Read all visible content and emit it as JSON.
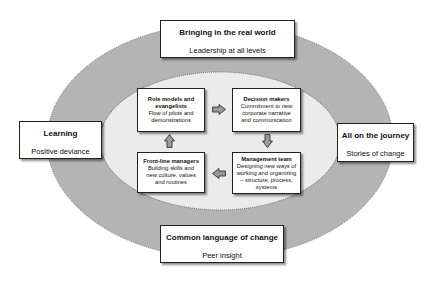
{
  "outer_ring": {
    "top": {
      "title": "Bringing in the real world",
      "subtitle": "Leadership at all levels"
    },
    "left": {
      "title": "Learning",
      "subtitle": "Positive deviance"
    },
    "right": {
      "title": "All on the journey",
      "subtitle": "Stories of change"
    },
    "bottom": {
      "title": "Common language of change",
      "subtitle": "Peer insight"
    }
  },
  "inner_cycle": {
    "role_models": {
      "title_line1": "Role models and",
      "title_line2": "evangelists",
      "desc_line1": "Flow of pilots and",
      "desc_line2": "demonstrations"
    },
    "decision_makers": {
      "title": "Decision makers",
      "desc_line1": "Commitment to new",
      "desc_line2": "corporate narrative",
      "desc_line3": "and communication"
    },
    "management_team": {
      "title": "Management team",
      "desc_line1": "Designing new ways of",
      "desc_line2": "working and organizing",
      "desc_line3": "– structure, process,",
      "desc_line4": "systems"
    },
    "front_line": {
      "title": "Front-line managers",
      "desc_line1": "Building skills and",
      "desc_line2": "new culture, values",
      "desc_line3": "and routines"
    }
  },
  "colors": {
    "outer_ellipse": "#b4b4b4",
    "inner_ellipse": "#ebebeb",
    "arrow_fill": "#9a9a9a",
    "border": "#222222"
  }
}
